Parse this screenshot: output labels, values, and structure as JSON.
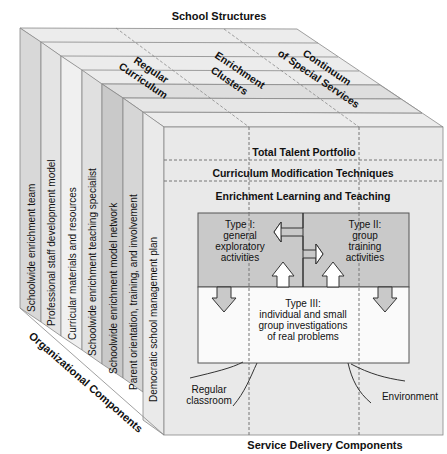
{
  "titles": {
    "top": "School Structures",
    "left": "Organizational Components",
    "bottom": "Service Delivery Components"
  },
  "school_structures": {
    "regular_curriculum": [
      "Regular",
      "Curriculum"
    ],
    "enrichment_clusters": [
      "Enrichment",
      "Clusters"
    ],
    "continuum": [
      "Continuum",
      "of Special Services"
    ]
  },
  "organizational_components": [
    "Schoolwide enrichment team",
    "Professional staff development model",
    "Curricular materials and resources",
    "Schoolwide enrichment teaching specialist",
    "Schoolwide enrichment model network",
    "Parent orientation, training, and involvement",
    "Democratic school management plan"
  ],
  "service_delivery": {
    "rows": [
      "Total Talent Portfolio",
      "Curriculum Modification Techniques",
      "Enrichment Learning and Teaching"
    ],
    "type1": [
      "Type I:",
      "general",
      "exploratory",
      "activities"
    ],
    "type2": [
      "Type II:",
      "group",
      "training",
      "activities"
    ],
    "type3": [
      "Type III:",
      "individual and small",
      "group investigations",
      "of real problems"
    ],
    "regular_classroom": [
      "Regular",
      "classroom"
    ],
    "environment": "Environment"
  },
  "colors": {
    "slab_light": "#efefef",
    "slab_mid": "#dcdcdc",
    "slab_dark": "#c8c8c8",
    "inner_gray": "#c9c9c9",
    "line": "#777777"
  }
}
